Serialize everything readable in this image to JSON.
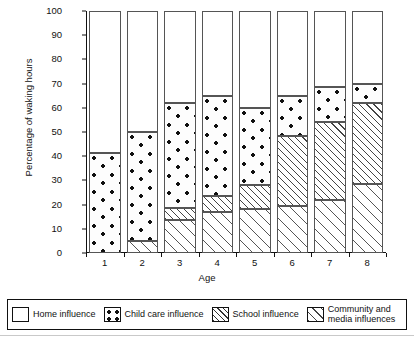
{
  "chart_data": {
    "type": "bar",
    "stacked": true,
    "title": "",
    "xlabel": "Age",
    "ylabel": "Percentage of waking hours",
    "categories": [
      "1",
      "2",
      "3",
      "4",
      "5",
      "6",
      "7",
      "8"
    ],
    "ylim": [
      0,
      100
    ],
    "yticks": [
      0,
      10,
      20,
      30,
      40,
      50,
      60,
      70,
      80,
      90,
      100
    ],
    "ytick_labels": [
      "0",
      "10",
      "20",
      "30",
      "40",
      "50",
      "60",
      "70",
      "80",
      "90",
      "100"
    ],
    "grid": false,
    "legend_position": "bottom",
    "series": [
      {
        "name": "Community and media influences",
        "pattern": "wide-diagonal-hatch",
        "values": [
          0,
          5,
          13.5,
          17,
          18,
          19.5,
          22,
          28.5
        ]
      },
      {
        "name": "School influence",
        "pattern": "dense-diagonal-hatch",
        "values": [
          0,
          0,
          5,
          6.5,
          10,
          29,
          32,
          33.5
        ]
      },
      {
        "name": "Child care influence",
        "pattern": "dots",
        "values": [
          41.5,
          45,
          43.5,
          41.5,
          32,
          16.5,
          14.5,
          8
        ]
      },
      {
        "name": "Home influence",
        "pattern": "solid-white",
        "values": [
          58.5,
          50,
          38,
          35,
          40,
          35,
          31.5,
          30
        ]
      }
    ],
    "cumulative_tops": {
      "community_and_media": [
        0,
        5,
        13.5,
        17,
        18,
        19.5,
        22,
        28.5
      ],
      "school": [
        0,
        5,
        18.5,
        23.5,
        28,
        48.5,
        54,
        62
      ],
      "child_care": [
        41.5,
        50,
        62,
        65,
        60,
        65,
        68.5,
        70
      ],
      "home": [
        100,
        100,
        100,
        100,
        100,
        100,
        100,
        100
      ]
    }
  },
  "legend": {
    "items": [
      {
        "label": "Home influence",
        "key": "home"
      },
      {
        "label": "Child care influence",
        "key": "childcare"
      },
      {
        "label": "School influence",
        "key": "school"
      },
      {
        "label": "Community and\nmedia influences",
        "key": "community"
      }
    ]
  },
  "colors": {
    "axis": "#111111",
    "segment_border": "#555555",
    "background": "#ffffff",
    "hatch": "#444444",
    "dot": "#111111"
  }
}
